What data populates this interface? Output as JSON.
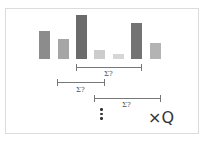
{
  "diagram": {
    "title": "",
    "bars": [
      {
        "x": 39,
        "top": 31,
        "color": "#8c8c8c"
      },
      {
        "x": 58,
        "top": 39,
        "color": "#a6a6a6"
      },
      {
        "x": 76,
        "top": 15,
        "color": "#6b6b6b"
      },
      {
        "x": 94,
        "top": 50,
        "color": "#cccccc"
      },
      {
        "x": 113,
        "top": 54,
        "color": "#d6d6d6"
      },
      {
        "x": 131,
        "top": 23,
        "color": "#737373"
      },
      {
        "x": 150,
        "top": 43,
        "color": "#b3b3b3"
      }
    ],
    "bar_baseline": 59,
    "queries": [
      {
        "x1": 76,
        "x2": 142,
        "y": 67,
        "label": "Σ?",
        "label_x": 104,
        "label_y": 70
      },
      {
        "x1": 57,
        "x2": 105,
        "y": 82,
        "label": "Σ?",
        "label_x": 76,
        "label_y": 86
      },
      {
        "x1": 94,
        "x2": 161,
        "y": 98,
        "label": "Σ?",
        "label_x": 122,
        "label_y": 101
      }
    ],
    "repeat_marker": "⋮",
    "multiplier_label": "×Q"
  }
}
